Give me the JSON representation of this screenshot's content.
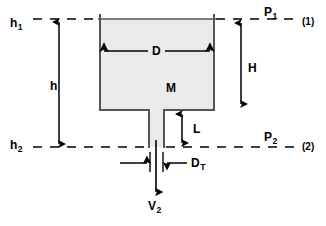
{
  "diagram": {
    "colors": {
      "stroke": "#000000",
      "tank_wall": "#555555",
      "tank_fill": "#eaeaea",
      "background": "#ffffff"
    },
    "labels": {
      "h1": "h",
      "h1_sub": "1",
      "h2": "h",
      "h2_sub": "2",
      "p1": "P",
      "p1_sub": "1",
      "p2": "P",
      "p2_sub": "2",
      "station1": "(1)",
      "station2": "(2)",
      "h": "h",
      "H": "H",
      "D": "D",
      "M": "M",
      "L": "L",
      "DT": "D",
      "DT_sub": "T",
      "V2": "V",
      "V2_sub": "2"
    },
    "geometry": {
      "tank_left": 100,
      "tank_right": 214,
      "tank_top": 19,
      "tank_bottom": 110,
      "tube_left": 149,
      "tube_right": 164,
      "tube_bottom": 147,
      "line1_y": 19,
      "line2_y": 147,
      "dash_start": 33,
      "dash_end": 295
    }
  }
}
